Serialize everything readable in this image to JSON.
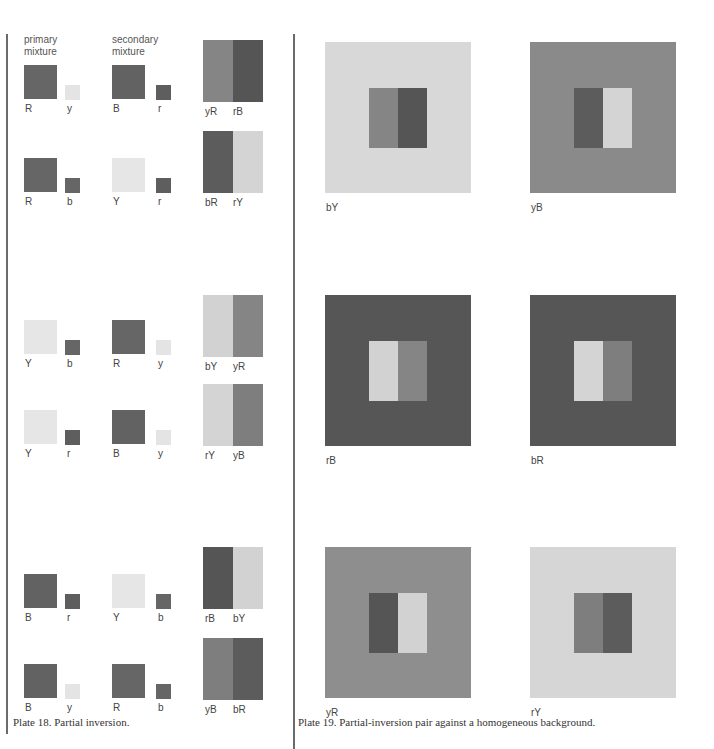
{
  "colors": {
    "R": "#666666",
    "B": "#626262",
    "Y": "#e6e6e6",
    "r": "#5e5e5e",
    "b": "#666666",
    "y": "#e4e4e4",
    "yR": "#858585",
    "rB": "#555555",
    "bR": "#5c5c5c",
    "rY": "#d4d4d4",
    "bY": "#d2d2d2",
    "yB": "#7e7e7e",
    "bgY": "#d8d8d8",
    "bgB": "#8a8a8a",
    "bgDark": "#565656",
    "bgR": "#8e8e8e",
    "bgLightY": "#d6d6d6"
  },
  "plate18": {
    "header_primary": "primary\nmixture",
    "header_secondary": "secondary\nmixture",
    "rows": [
      {
        "p_big": "R",
        "p_small": "y",
        "s_big": "B",
        "s_small": "r",
        "pair_left": "yR",
        "pair_right": "rB"
      },
      {
        "p_big": "R",
        "p_small": "b",
        "s_big": "Y",
        "s_small": "r",
        "pair_left": "bR",
        "pair_right": "rY"
      },
      {
        "p_big": "Y",
        "p_small": "b",
        "s_big": "R",
        "s_small": "y",
        "pair_left": "bY",
        "pair_right": "yR"
      },
      {
        "p_big": "Y",
        "p_small": "r",
        "s_big": "B",
        "s_small": "y",
        "pair_left": "rY",
        "pair_right": "yB"
      },
      {
        "p_big": "B",
        "p_small": "r",
        "s_big": "Y",
        "s_small": "b",
        "pair_left": "rB",
        "pair_right": "bY"
      },
      {
        "p_big": "B",
        "p_small": "y",
        "s_big": "R",
        "s_small": "b",
        "pair_left": "yB",
        "pair_right": "bR"
      }
    ],
    "caption": "Plate 18. Partial inversion."
  },
  "plate19": {
    "plates": [
      {
        "label": "bY"
      },
      {
        "label": "yB"
      },
      {
        "label": "rB"
      },
      {
        "label": "bR"
      },
      {
        "label": "yR"
      },
      {
        "label": "rY"
      }
    ],
    "caption": "Plate 19. Partial-inversion pair against a homogeneous background."
  }
}
